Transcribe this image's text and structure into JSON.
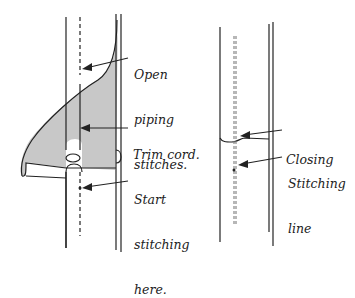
{
  "figure": {
    "left_panel": {
      "labels": {
        "open_piping_stitches": [
          "Open",
          "piping",
          "stitches."
        ],
        "trim_cord": [
          "Trim cord."
        ],
        "start_stitching_here": [
          "Start",
          "stitching",
          "here."
        ]
      }
    },
    "right_panel": {
      "labels": {
        "closing": [
          "Closing"
        ],
        "stitching_line": [
          "Stitching",
          "line"
        ]
      }
    }
  },
  "colors": {
    "line": "#222222",
    "fill_shaded": "#c8c8c8",
    "background": "#ffffff"
  }
}
